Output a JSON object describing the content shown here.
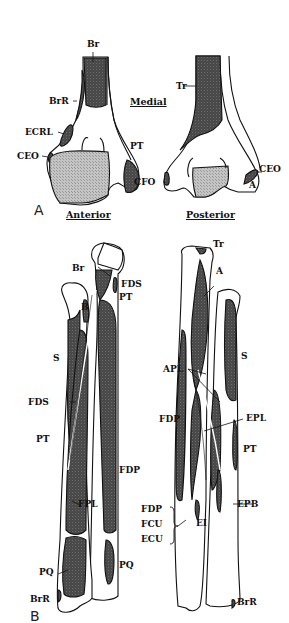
{
  "figure": {
    "panel_a": {
      "letter": "A",
      "heading": "Medial",
      "labels": {
        "br": "Br",
        "brr": "BrR",
        "ecrl": "ECRL",
        "ceo_left": "CEO",
        "pt": "PT",
        "cfo": "CFO",
        "tr": "Tr",
        "ceo_right": "CEO",
        "a": "A"
      }
    },
    "panel_b": {
      "letter": "B",
      "heading_left": "Anterior",
      "heading_right": "Posterior",
      "anterior_labels": {
        "br": "Br",
        "fds_top": "FDS",
        "pt_top": "PT",
        "b": "B",
        "s": "S",
        "fds": "FDS",
        "pt": "PT",
        "fdp": "FDP",
        "fpl": "FPL",
        "pq_left": "PQ",
        "pq_right": "PQ",
        "brr": "BrR"
      },
      "posterior_labels": {
        "tr": "Tr",
        "a": "A",
        "s": "S",
        "apl": "APL",
        "fdp": "FDP",
        "epl": "EPL",
        "pt": "PT",
        "group_fdp": "FDP",
        "group_fcu": "FCU",
        "group_ecu": "ECU",
        "ei": "EI",
        "epb": "EPB",
        "brr": "BrR"
      }
    },
    "colors": {
      "muscle_dark": "#4a4a4a",
      "muscle_light": "#b8b8b8",
      "outline": "#111111",
      "background": "#ffffff"
    }
  }
}
